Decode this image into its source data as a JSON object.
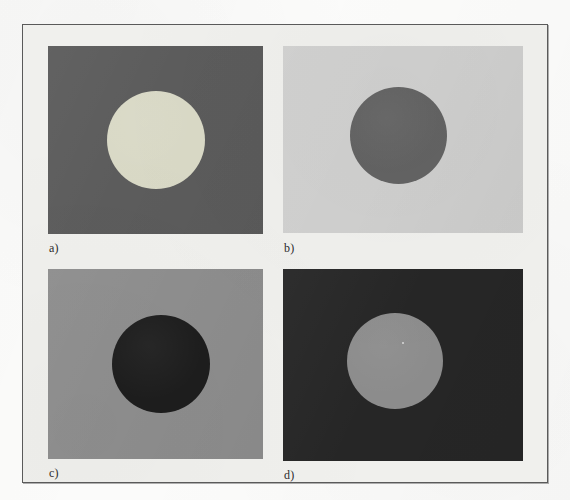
{
  "figure": {
    "background_color": "#fbfbfa",
    "frame_fill_color": "#f0f0ed",
    "frame_border_color": "#5a5a5a"
  },
  "chart_data": {
    "type": "table",
    "title": "",
    "subtitle": "",
    "xlabel": "",
    "ylabel": "",
    "layout": "2x2 grid of square background swatches, each containing one centered circular disc",
    "legend": [],
    "annotations": [],
    "categories": [
      "a)",
      "b)",
      "c)",
      "d)"
    ],
    "series": [
      {
        "name": "background luminance (0-255)",
        "values": [
          92,
          208,
          142,
          38
        ]
      },
      {
        "name": "disc luminance (0-255)",
        "values": [
          217,
          99,
          29,
          140
        ]
      }
    ],
    "panels": [
      {
        "label": "a)",
        "background_color": "#5c5c5c",
        "background_name": "dark gray",
        "disc_color": "#d9d9c6",
        "disc_name": "light cream gray",
        "disc_shape": "circle"
      },
      {
        "label": "b)",
        "background_color": "#d0d0cf",
        "background_name": "light gray",
        "disc_color": "#636363",
        "disc_name": "medium dark gray",
        "disc_shape": "circle"
      },
      {
        "label": "c)",
        "background_color": "#8e8e8e",
        "background_name": "medium gray",
        "disc_color": "#1d1d1d",
        "disc_name": "near black",
        "disc_shape": "circle"
      },
      {
        "label": "d)",
        "background_color": "#262626",
        "background_name": "near black",
        "disc_color": "#8c8c8c",
        "disc_name": "medium gray",
        "disc_shape": "circle"
      }
    ]
  }
}
